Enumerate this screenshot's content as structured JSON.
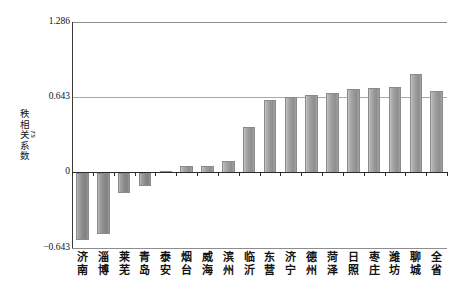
{
  "chart_data": {
    "type": "bar",
    "title": "",
    "xlabel": "",
    "ylabel": "秩相关系数",
    "ylabel_sub": "rs",
    "ylim": [
      -0.643,
      1.286
    ],
    "yticks": [
      "1.286",
      "0.643",
      "0",
      "−0.643"
    ],
    "ytick_values": [
      1.286,
      0.643,
      0,
      -0.643
    ],
    "grid": "horizontal-at-0.643-and-frame",
    "legend": "none",
    "bar_color": "#9a9a9a",
    "axis_color": "#2b2b2b",
    "gridline_color": "#a8a8a8",
    "categories": [
      "济南",
      "淄博",
      "莱芜",
      "青岛",
      "泰安",
      "烟台",
      "威海",
      "滨州",
      "临沂",
      "东营",
      "济宁",
      "德州",
      "菏泽",
      "日照",
      "枣庄",
      "潍坊",
      "聊城",
      "全省"
    ],
    "category_lines": [
      [
        "济",
        "南"
      ],
      [
        "淄",
        "博"
      ],
      [
        "莱",
        "芜"
      ],
      [
        "青",
        "岛"
      ],
      [
        "泰",
        "安"
      ],
      [
        "烟",
        "台"
      ],
      [
        "威",
        "海"
      ],
      [
        "滨",
        "州"
      ],
      [
        "临",
        "沂"
      ],
      [
        "东",
        "营"
      ],
      [
        "济",
        "宁"
      ],
      [
        "德",
        "州"
      ],
      [
        "菏",
        "泽"
      ],
      [
        "日",
        "照"
      ],
      [
        "枣",
        "庄"
      ],
      [
        "潍",
        "坊"
      ],
      [
        "聊",
        "城"
      ],
      [
        "全",
        "省"
      ]
    ],
    "values": [
      -0.574,
      -0.523,
      -0.171,
      -0.111,
      0.017,
      0.06,
      0.06,
      0.103,
      0.386,
      0.617,
      0.643,
      0.66,
      0.677,
      0.711,
      0.72,
      0.729,
      0.84,
      0.694
    ]
  }
}
